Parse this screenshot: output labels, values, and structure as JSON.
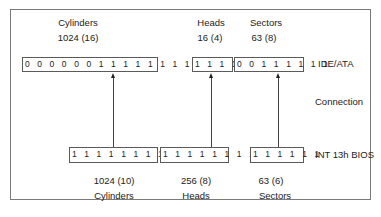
{
  "diagram": {
    "title": "",
    "rows": {
      "top": {
        "label": "IDE/ATA",
        "fields": [
          {
            "name": "Cylinders",
            "value": "1024 (16)",
            "bits": "0 0 0 0 0 0 1 1 1 1 1 1 1 1 1 1"
          },
          {
            "name": "Heads",
            "value": "16 (4)",
            "bits": "1 1 1 1"
          },
          {
            "name": "Sectors",
            "value": "63 (8)",
            "bits": "0 0 1 1 1 1 1 1"
          }
        ]
      },
      "middle": {
        "label": "Connection"
      },
      "bottom": {
        "label": "INT 13h BIOS",
        "fields": [
          {
            "name": "Cylinders",
            "value": "1024 (10)",
            "bits": "1 1 1 1 1 1 1 1 1 1"
          },
          {
            "name": "Heads",
            "value": "256 (8)",
            "bits": "1 1 1 1 1 1 1 1"
          },
          {
            "name": "Sectors",
            "value": "63 (6)",
            "bits": "1 1 1 1 1 1"
          }
        ]
      }
    }
  }
}
